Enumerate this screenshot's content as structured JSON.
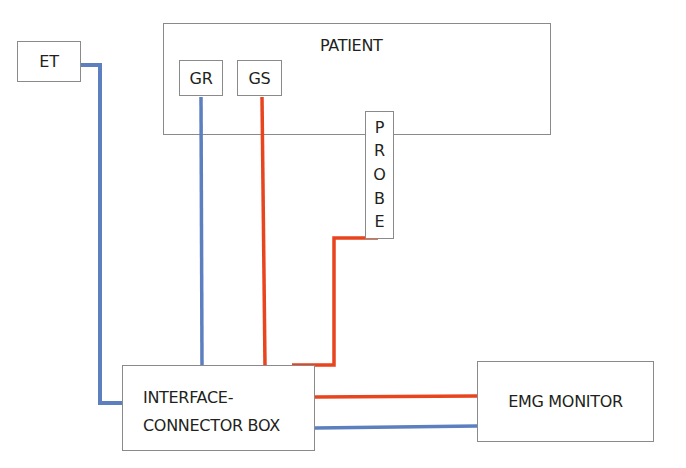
{
  "diagram": {
    "colors": {
      "blue_wire": "#5b7fbf",
      "red_wire": "#e8441e",
      "box_border": "#8a8a8a",
      "text": "#231f20"
    },
    "nodes": {
      "et": {
        "label": "ET"
      },
      "patient": {
        "label": "PATIENT"
      },
      "gr": {
        "label": "GR"
      },
      "gs": {
        "label": "GS"
      },
      "probe": {
        "label": "PROBE",
        "letters": [
          "P",
          "R",
          "O",
          "B",
          "E"
        ]
      },
      "interface": {
        "label_line1": "INTERFACE-",
        "label_line2": "CONNECTOR BOX"
      },
      "emg": {
        "label": "EMG MONITOR"
      }
    },
    "connections": [
      {
        "from": "ET",
        "to": "INTERFACE-CONNECTOR BOX",
        "color": "blue"
      },
      {
        "from": "GR",
        "to": "INTERFACE-CONNECTOR BOX",
        "color": "blue"
      },
      {
        "from": "GS",
        "to": "INTERFACE-CONNECTOR BOX",
        "color": "red"
      },
      {
        "from": "PROBE",
        "to": "INTERFACE-CONNECTOR BOX",
        "color": "red"
      },
      {
        "from": "INTERFACE-CONNECTOR BOX",
        "to": "EMG MONITOR",
        "color": "red"
      },
      {
        "from": "INTERFACE-CONNECTOR BOX",
        "to": "EMG MONITOR",
        "color": "blue"
      }
    ]
  }
}
